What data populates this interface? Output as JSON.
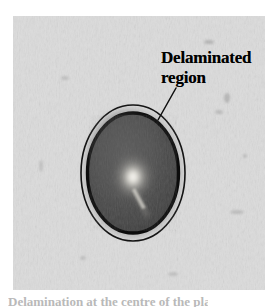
{
  "figure": {
    "type": "photograph-with-annotation",
    "domain": "micrograph / ultrasonic C-scan of delamination",
    "background_color": "#ffffff",
    "photo": {
      "name": "specimen-photograph",
      "left": 13,
      "top": 16,
      "width": 252,
      "height": 274,
      "base_color": "#d9d9d9",
      "texture": "mottled vertical-streak grain, light gray"
    },
    "annotation": {
      "line1": "Delaminated",
      "line2": "region",
      "color": "#000000",
      "leader_line": {
        "name": "leader-line",
        "from_x": 176,
        "from_y": 88,
        "to_x": 158,
        "to_y": 120,
        "color": "#000000",
        "width": 1.4
      }
    },
    "ellipse_outer": {
      "name": "delamination-outline",
      "cx": 133,
      "cy": 173,
      "rx": 52,
      "ry": 68,
      "stroke": "#111111",
      "stroke_width": 1.6,
      "fill": "none"
    },
    "ellipse_halo": {
      "name": "delamination-halo",
      "cx": 133,
      "cy": 173,
      "rx": 49,
      "ry": 64,
      "fill": "#b9b9b9"
    },
    "ellipse_ring": {
      "name": "delamination-ring",
      "cx": 133,
      "cy": 173,
      "rx": 46,
      "ry": 61,
      "stroke": "#0d0d0d",
      "stroke_width": 3.2,
      "fill": "#4d4d4d"
    },
    "bright_spot": {
      "name": "impact-bright-spot",
      "cx": 133,
      "cy": 177,
      "rx": 11,
      "ry": 13,
      "color": "#f2f0ea"
    },
    "streak": {
      "name": "bright-streak",
      "x1": 136,
      "y1": 188,
      "x2": 145,
      "y2": 205,
      "color": "#cfcdc6"
    }
  },
  "caption": {
    "partial_text": "Delamination at the centre of the plate"
  },
  "colors": {
    "page_background": "#ffffff",
    "photo_gray": "#d9d9d9",
    "delamination_dark": "#4d4d4d",
    "outline_black": "#111111",
    "text_black": "#000000"
  }
}
